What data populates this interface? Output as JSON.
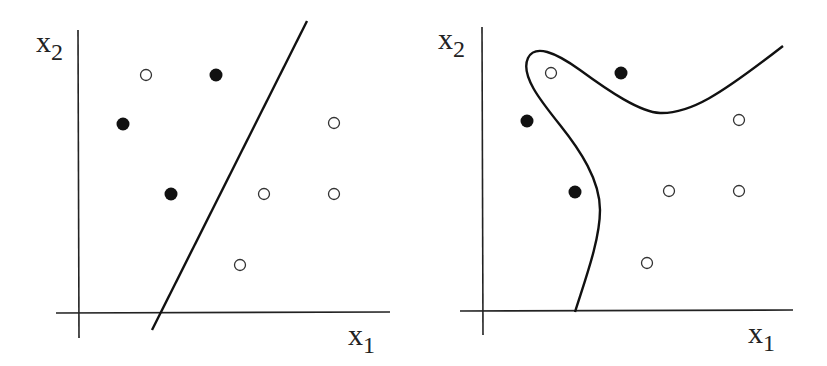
{
  "figure": {
    "panels": [
      {
        "id": "linear",
        "x_axis_label": "x",
        "x_axis_sub": "1",
        "y_axis_label": "x",
        "y_axis_sub": "2",
        "boundary": "straight line"
      },
      {
        "id": "nonlinear",
        "x_axis_label": "x",
        "x_axis_sub": "1",
        "y_axis_label": "x",
        "y_axis_sub": "2",
        "boundary": "curved line"
      }
    ]
  },
  "chart_data": [
    {
      "type": "scatter",
      "title": "",
      "xlabel": "x1",
      "ylabel": "x2",
      "series": [
        {
          "name": "filled",
          "points": [
            [
              216,
              75
            ],
            [
              123,
              124
            ],
            [
              171,
              194
            ]
          ]
        },
        {
          "name": "open",
          "points": [
            [
              146,
              75
            ],
            [
              334,
              123
            ],
            [
              264,
              194
            ],
            [
              334,
              194
            ],
            [
              240,
              265
            ]
          ]
        }
      ],
      "decision_boundary": {
        "type": "line",
        "from": [
          152,
          330
        ],
        "to": [
          307,
          21
        ]
      }
    },
    {
      "type": "scatter",
      "title": "",
      "xlabel": "x1",
      "ylabel": "x2",
      "series": [
        {
          "name": "filled",
          "points": [
            [
              621,
              73
            ],
            [
              527,
              121
            ],
            [
              575,
              192
            ]
          ]
        },
        {
          "name": "open",
          "points": [
            [
              551,
              73
            ],
            [
              739,
              120
            ],
            [
              669,
              191
            ],
            [
              739,
              191
            ],
            [
              647,
              263
            ]
          ]
        }
      ],
      "decision_boundary": {
        "type": "curve"
      }
    }
  ]
}
